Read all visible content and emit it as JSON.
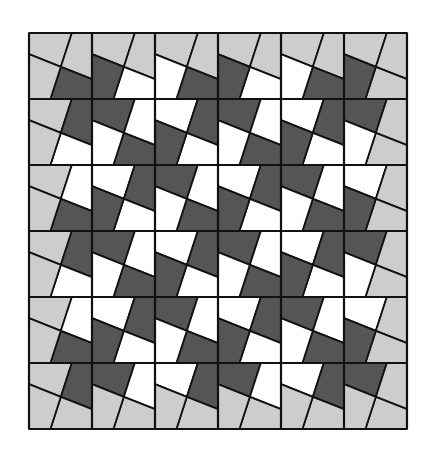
{
  "figure": {
    "rows": 6,
    "cols": 6,
    "origin": [
      29,
      33
    ],
    "cell_width": 63,
    "cell_height": 66,
    "cut_lines": {
      "top_to_bottom": [
        [
          0.68,
          0
        ],
        [
          0.34,
          1
        ]
      ],
      "left_to_right": [
        [
          0,
          0.32
        ],
        [
          1,
          0.7
        ]
      ]
    },
    "colors": {
      "light": "#cdcdcd",
      "dark": "#555555",
      "white": "#ffffff",
      "line": "#111111"
    },
    "rule": "Quadrant grid 12x12; border quadrants light; interior quadrants alternate dark/white in 2x2 blocks offset by one quadrant"
  }
}
